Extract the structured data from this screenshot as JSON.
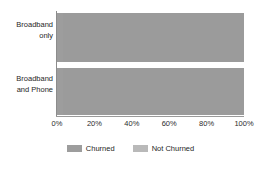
{
  "chart_data": {
    "type": "bar",
    "subtype": "stacked-horizontal-100pct",
    "title": "",
    "xlabel": "",
    "ylabel": "",
    "orientation": "horizontal",
    "stacked": true,
    "grid": false,
    "legend_position": "bottom",
    "xlim": [
      0,
      100
    ],
    "xticks": [
      0,
      20,
      40,
      60,
      80,
      100
    ],
    "xtick_labels": [
      "0%",
      "20%",
      "40%",
      "60%",
      "80%",
      "100%"
    ],
    "categories": [
      "Broadband only",
      "Broadband and Phone"
    ],
    "category_lines": [
      [
        "Broadband",
        "only"
      ],
      [
        "Broadband",
        "and Phone"
      ]
    ],
    "series": [
      {
        "name": "Churned",
        "color": "#9d9d9d",
        "values": [
          3,
          3
        ]
      },
      {
        "name": "Not Churned",
        "color": "#9b9b9b",
        "values": [
          97,
          97
        ]
      }
    ],
    "legend": [
      {
        "label": "Churned",
        "color": "#9d9d9d"
      },
      {
        "label": "Not Churned",
        "color": "#b9b9b9"
      }
    ],
    "axis_color": "#8c8c8c",
    "text_color": "#262626",
    "background": "#ffffff"
  }
}
